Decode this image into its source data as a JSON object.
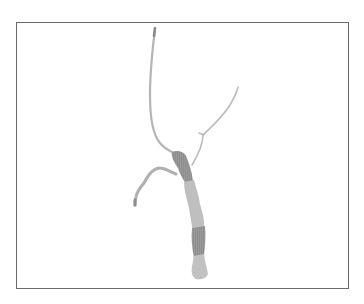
{
  "figure": {
    "colors": {
      "frame": "#6a6a6a",
      "branch_light": "#b8b8b8",
      "trunk_light": "#bdbdbd",
      "trunk_dark": "#8e8e8e",
      "background": "#ffffff"
    }
  }
}
